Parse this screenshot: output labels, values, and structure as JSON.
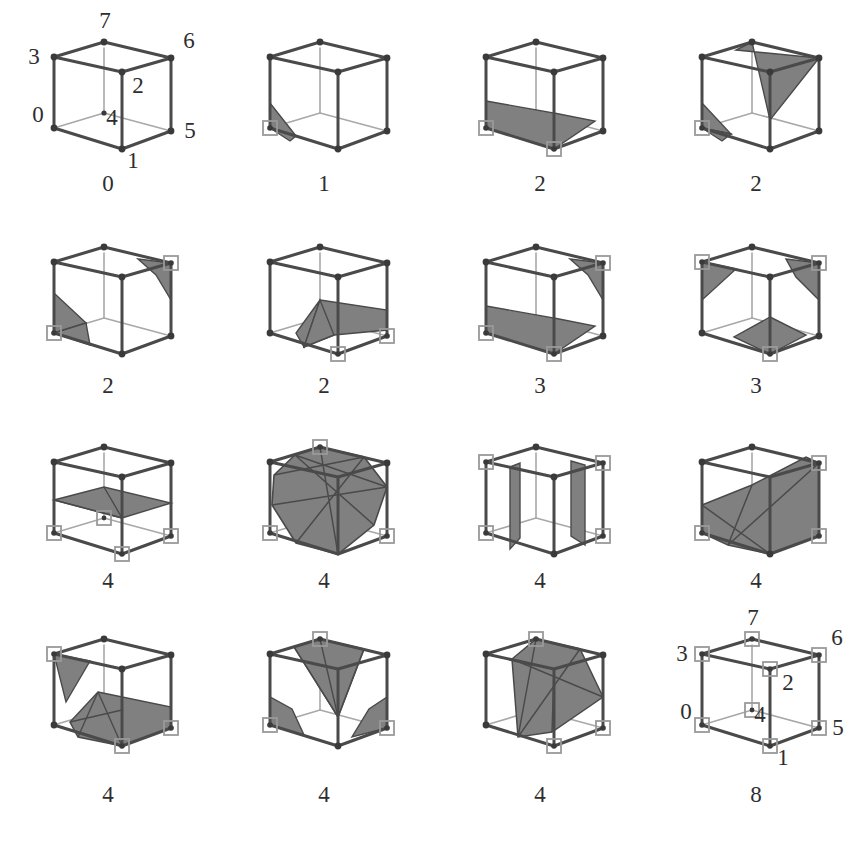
{
  "figure": {
    "rows": 4,
    "columns": 4,
    "ink_color": "#4a4a4a",
    "hidden_edge_color": "#a8a8a8",
    "fill_color": "#808080",
    "marker_color": "#9a9a9a",
    "background": "#ffffff"
  },
  "vertex_labels": {
    "v0": "0",
    "v1": "1",
    "v2": "2",
    "v3": "3",
    "v4": "4",
    "v5": "5",
    "v6": "6",
    "v7": "7"
  },
  "panels": [
    {
      "id": "case-0",
      "case_label": "0",
      "marked_vertices": [],
      "marked_count": 0,
      "labelled": true,
      "description": "empty cube with vertex index labels"
    },
    {
      "id": "case-1",
      "case_label": "1",
      "marked_vertices": [
        "v0"
      ],
      "marked_count": 1,
      "labelled": false,
      "description": "single corner triangle"
    },
    {
      "id": "case-2a",
      "case_label": "2",
      "marked_vertices": [
        "v0",
        "v1"
      ],
      "marked_count": 2,
      "labelled": false,
      "description": "two adjacent corners along bottom front edge"
    },
    {
      "id": "case-2b",
      "case_label": "2",
      "marked_vertices": [
        "v0",
        "v2"
      ],
      "marked_count": 2,
      "labelled": false,
      "description": "two corners diagonal on a face, separate patches"
    },
    {
      "id": "case-2c",
      "case_label": "2",
      "marked_vertices": [
        "v0",
        "v6"
      ],
      "marked_count": 2,
      "labelled": false,
      "description": "two body-diagonal corners, two separate triangles"
    },
    {
      "id": "case-2d",
      "case_label": "2",
      "marked_vertices": [
        "v1",
        "v5"
      ],
      "marked_count": 2,
      "labelled": false,
      "description": "two corners on same vertical edge pair, folded quad"
    },
    {
      "id": "case-3a",
      "case_label": "3",
      "marked_vertices": [
        "v0",
        "v1",
        "v6"
      ],
      "marked_count": 3,
      "labelled": false,
      "description": "adjacent pair plus far diagonal corner"
    },
    {
      "id": "case-3b",
      "case_label": "3",
      "marked_vertices": [
        "v1",
        "v3",
        "v6"
      ],
      "marked_count": 3,
      "labelled": false,
      "description": "three mutually isolated corners"
    },
    {
      "id": "case-4a",
      "case_label": "4",
      "marked_vertices": [
        "v0",
        "v1",
        "v4",
        "v5"
      ],
      "marked_count": 4,
      "labelled": false,
      "description": "whole bottom face marked, flat horizontal plane"
    },
    {
      "id": "case-4b",
      "case_label": "4",
      "marked_vertices": [
        "v0",
        "v2",
        "v5",
        "v7"
      ],
      "marked_count": 4,
      "labelled": false,
      "description": "four alternating corners, large hexagonal shell"
    },
    {
      "id": "case-4c",
      "case_label": "4",
      "marked_vertices": [
        "v0",
        "v3",
        "v4",
        "v7"
      ],
      "marked_count": 4,
      "labelled": false,
      "description": "two opposite vertical wall patches"
    },
    {
      "id": "case-4d",
      "case_label": "4",
      "marked_vertices": [
        "v0",
        "v1",
        "v5",
        "v6"
      ],
      "marked_count": 4,
      "labelled": false,
      "description": "staircase band across the cube"
    },
    {
      "id": "case-4e",
      "case_label": "4",
      "marked_vertices": [
        "v0",
        "v1",
        "v3",
        "v5"
      ],
      "marked_count": 4,
      "labelled": false,
      "description": "corner triangle plus folded ribbon"
    },
    {
      "id": "case-4f",
      "case_label": "4",
      "marked_vertices": [
        "v0",
        "v2",
        "v5",
        "v7"
      ],
      "marked_count": 4,
      "labelled": false,
      "description": "three corner triangles plus top wedge"
    },
    {
      "id": "case-4g",
      "case_label": "4",
      "marked_vertices": [
        "v1",
        "v5",
        "v7"
      ],
      "marked_count": 4,
      "labelled": false,
      "description": "large slanted block spanning cube interior"
    },
    {
      "id": "case-8",
      "case_label": "8",
      "marked_vertices": [
        "v0",
        "v1",
        "v2",
        "v3",
        "v4",
        "v5",
        "v6",
        "v7"
      ],
      "marked_count": 8,
      "labelled": true,
      "description": "all eight corners marked, no surface, vertex labels shown"
    }
  ]
}
